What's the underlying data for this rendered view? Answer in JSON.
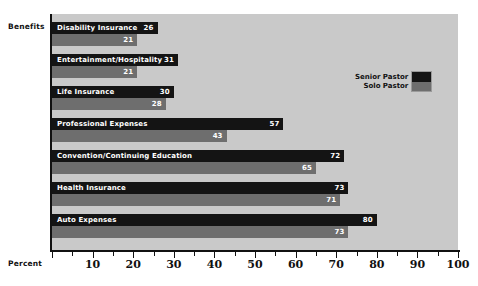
{
  "chart_data": {
    "type": "bar",
    "orientation": "horizontal",
    "title": "",
    "xlabel": "Percent",
    "ylabel": "Benefits",
    "xlim": [
      0,
      100
    ],
    "xticks": [
      0,
      10,
      20,
      30,
      40,
      50,
      60,
      70,
      80,
      90,
      100
    ],
    "xticklabels": [
      "",
      "10",
      "20",
      "30",
      "40",
      "50",
      "60",
      "70",
      "80",
      "90",
      "100"
    ],
    "minor_ticks": [
      5,
      15,
      25,
      35,
      45,
      55,
      65,
      75,
      85,
      95
    ],
    "grid": false,
    "legend_position": "upper right",
    "categories": [
      "Disability Insurance",
      "Entertainment/Hospitality",
      "Life Insurance",
      "Professional Expenses",
      "Convention/Continuing Education",
      "Health Insurance",
      "Auto Expenses"
    ],
    "series": [
      {
        "name": "Senior Pastor",
        "color": "#141414",
        "values": [
          26,
          31,
          30,
          57,
          72,
          73,
          80
        ]
      },
      {
        "name": "Solo Pastor",
        "color": "#6e6e6e",
        "values": [
          21,
          21,
          28,
          43,
          65,
          71,
          73
        ]
      }
    ]
  },
  "legend": {
    "items": [
      {
        "label": "Senior Pastor",
        "color": "#141414"
      },
      {
        "label": "Solo Pastor",
        "color": "#6e6e6e"
      }
    ]
  },
  "colors": {
    "plot_background": "#c9c9c9",
    "page_background": "#ffffff",
    "axis": "#111111",
    "senior": "#141414",
    "solo": "#6e6e6e",
    "bar_text": "#ffffff"
  }
}
